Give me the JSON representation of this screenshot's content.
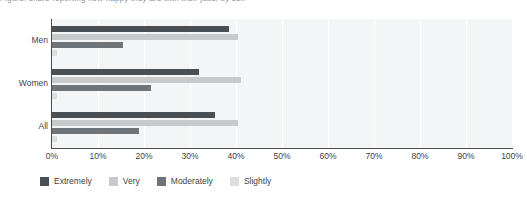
{
  "caption": {
    "text": "Figure: share reporting how happy they are with their jobs, by sex"
  },
  "chart_data": {
    "type": "bar",
    "orientation": "horizontal",
    "grouped": true,
    "title": "",
    "subtitle": "",
    "xlabel": "",
    "ylabel": "",
    "categories": [
      "Men",
      "Women",
      "All"
    ],
    "series": [
      {
        "name": "Extremely",
        "color": "#4a4f54",
        "values": [
          38.5,
          32.0,
          35.5
        ]
      },
      {
        "name": "Very",
        "color": "#c7c9cb",
        "values": [
          40.5,
          41.0,
          40.5
        ]
      },
      {
        "name": "Moderately",
        "color": "#6f7479",
        "values": [
          15.5,
          21.5,
          19.0
        ]
      },
      {
        "name": "Slightly",
        "color": "#dcdedf",
        "values": [
          1.0,
          1.0,
          1.0
        ]
      }
    ],
    "xlim": [
      0,
      100
    ],
    "xticks": [
      0,
      10,
      20,
      30,
      40,
      50,
      60,
      70,
      80,
      90,
      100
    ],
    "xtick_labels": [
      "0%",
      "10%",
      "20%",
      "30%",
      "40%",
      "50%",
      "60%",
      "70%",
      "80%",
      "90%",
      "100%"
    ],
    "grid": "vertical",
    "legend_position": "bottom-left",
    "value_suffix": "%",
    "plot_background": "#f4f5f6",
    "gridline_color": "#ffffff",
    "axis_color": "#4d4d4d"
  }
}
